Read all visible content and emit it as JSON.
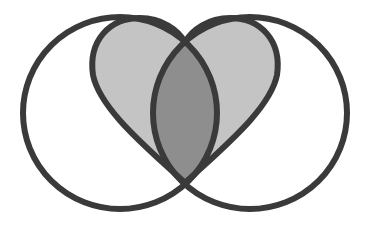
{
  "figure": {
    "type": "venn-heart-illustration",
    "colors": {
      "background": "#ffffff",
      "outline": "#3a3a3a",
      "heart_fill": "#c4c4c4",
      "overlap_fill": "#8e8e8e",
      "circle_fill": "#ffffff"
    },
    "shapes": [
      "left-circle",
      "right-circle",
      "heart",
      "lens-overlap"
    ]
  }
}
